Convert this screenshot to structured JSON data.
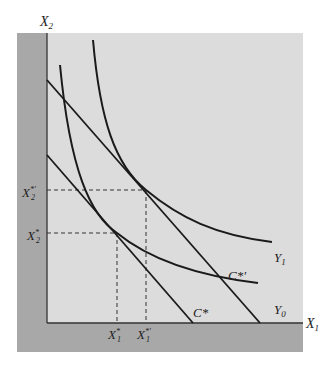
{
  "axes": {
    "x_label": "X",
    "x_sub": "1",
    "y_label": "X",
    "y_sub": "2"
  },
  "curves": {
    "y0": {
      "label": "Y",
      "sub": "0"
    },
    "y1": {
      "label": "Y",
      "sub": "1"
    }
  },
  "lines": {
    "c_star": {
      "label": "C*"
    },
    "c_star_prime": {
      "label": "C*'"
    }
  },
  "ticks": {
    "x1_star": {
      "label": "X",
      "sup": "*",
      "sub": "1"
    },
    "x1_star_prime": {
      "label": "X",
      "sup": "*'",
      "sub": "1"
    },
    "x2_star": {
      "label": "X",
      "sup": "*",
      "sub": "2"
    },
    "x2_star_prime": {
      "label": "X",
      "sup": "*'",
      "sub": "2"
    }
  },
  "colors": {
    "panel": "#dcdcdc",
    "strip": "#a8a8a8",
    "line": "#1a1a1a"
  }
}
